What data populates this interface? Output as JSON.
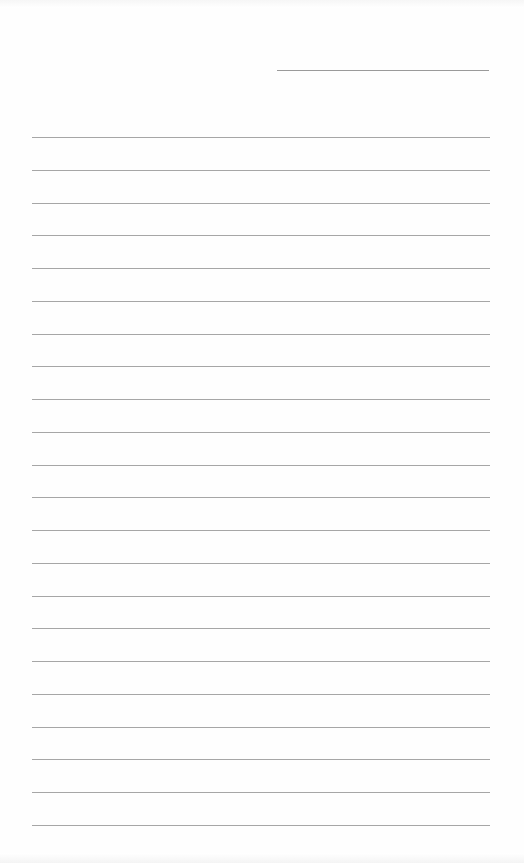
{
  "document": {
    "type": "lined-paper",
    "header_line": {
      "x": 277,
      "y": 70,
      "width": 212
    },
    "rules": {
      "count": 22,
      "x": 32,
      "width": 458,
      "first_y": 137,
      "spacing": 32.76
    },
    "colors": {
      "paper": "#fefefe",
      "rule": "#a6a6a6",
      "header_line": "#9a9a9a"
    }
  }
}
